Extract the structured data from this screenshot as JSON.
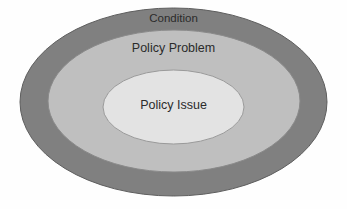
{
  "diagram": {
    "type": "concentric-ellipses",
    "background_color": "#fefefe",
    "rings": [
      {
        "id": "condition",
        "label": "Condition",
        "level": 1,
        "fill_color": "#808080",
        "stroke_color": "#5e5e5e",
        "cx": 173.5,
        "cy": 102,
        "rx": 153.5,
        "ry": 94
      },
      {
        "id": "policy-problem",
        "label": "Policy Problem",
        "level": 2,
        "fill_color": "#bfbfbf",
        "stroke_color": "#8a8a8a",
        "cx": 174,
        "cy": 101,
        "rx": 126,
        "ry": 71
      },
      {
        "id": "policy-issue",
        "label": "Policy Issue",
        "level": 3,
        "fill_color": "#e3e3e3",
        "stroke_color": "#9a9a9a",
        "cx": 173.5,
        "cy": 107,
        "rx": 70.5,
        "ry": 37
      }
    ],
    "label_color": "#2b2b2b"
  }
}
